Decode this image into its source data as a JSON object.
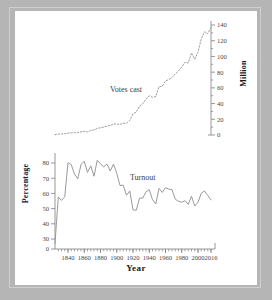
{
  "figure": {
    "background": "#b5b5b5",
    "canvas_background": "#ffffff",
    "line_color": "#9a9a9a",
    "axis_color": "#7d7d7d",
    "text_color": "#3d3d3d"
  },
  "labels": {
    "xlabel": "Year",
    "ylabel_left": "Percentage",
    "ylabel_right": "Million",
    "series_votes": "Votes cast",
    "series_turnout": "Turnout"
  },
  "chart_data": {
    "type": "line",
    "title": "",
    "xlabel": "Year",
    "grid": false,
    "legend": "inline-annotations",
    "xlim": [
      1824,
      2016
    ],
    "xticks": [
      1840,
      1860,
      1880,
      1900,
      1920,
      1940,
      1960,
      1980,
      2000,
      2016
    ],
    "xtick_labels": [
      "1840",
      "1860",
      "1880",
      "1900",
      "1920",
      "1940",
      "1960",
      "1980",
      "2000",
      "2016"
    ],
    "xtick_minor_step": 4,
    "axes": [
      {
        "name": "left",
        "label": "Percentage",
        "ylim": [
          0,
          85
        ],
        "ticks": [
          0,
          30,
          40,
          50,
          60,
          70,
          80
        ],
        "tick_labels": [
          "0",
          "30",
          "40",
          "50",
          "60",
          "70",
          "80"
        ],
        "broken": true,
        "note": "axis is broken between 0 and 30"
      },
      {
        "name": "right",
        "label": "Million",
        "ylim": [
          0,
          140
        ],
        "ticks": [
          0,
          20,
          40,
          60,
          80,
          100,
          120,
          140
        ],
        "tick_labels": [
          "0",
          "20",
          "40",
          "60",
          "80",
          "100",
          "120",
          "140"
        ],
        "minor_step": 10
      }
    ],
    "series": [
      {
        "name": "Turnout",
        "axis": "left",
        "unit": "percent",
        "style": "solid",
        "x": [
          1824,
          1828,
          1832,
          1836,
          1840,
          1844,
          1848,
          1852,
          1856,
          1860,
          1864,
          1868,
          1872,
          1876,
          1880,
          1884,
          1888,
          1892,
          1896,
          1900,
          1904,
          1908,
          1912,
          1916,
          1920,
          1924,
          1928,
          1932,
          1936,
          1940,
          1944,
          1948,
          1952,
          1956,
          1960,
          1964,
          1968,
          1972,
          1976,
          1980,
          1984,
          1988,
          1992,
          1996,
          2000,
          2004,
          2008,
          2012,
          2016
        ],
        "values": [
          26.9,
          57.6,
          55.4,
          57.8,
          80.2,
          78.9,
          72.7,
          69.6,
          78.9,
          81.2,
          73.8,
          78.1,
          71.3,
          81.8,
          79.4,
          77.5,
          79.3,
          74.7,
          79.3,
          73.2,
          65.2,
          65.4,
          58.8,
          61.6,
          49.2,
          48.9,
          56.9,
          56.9,
          61.0,
          62.5,
          55.9,
          53.0,
          63.3,
          60.6,
          63.8,
          62.8,
          62.5,
          56.2,
          54.8,
          54.2,
          55.2,
          52.8,
          58.1,
          51.7,
          54.2,
          60.1,
          61.6,
          58.6,
          55.7
        ]
      },
      {
        "name": "Votes cast",
        "axis": "right",
        "unit": "million",
        "style": "dotted",
        "x": [
          1824,
          1828,
          1832,
          1836,
          1840,
          1844,
          1848,
          1852,
          1856,
          1860,
          1864,
          1868,
          1872,
          1876,
          1880,
          1884,
          1888,
          1892,
          1896,
          1900,
          1904,
          1908,
          1912,
          1916,
          1920,
          1924,
          1928,
          1932,
          1936,
          1940,
          1944,
          1948,
          1952,
          1956,
          1960,
          1964,
          1968,
          1972,
          1976,
          1980,
          1984,
          1988,
          1992,
          1996,
          2000,
          2004,
          2008,
          2012,
          2016
        ],
        "values": [
          0.4,
          1.2,
          1.3,
          1.5,
          2.4,
          2.7,
          2.9,
          3.1,
          4.0,
          4.7,
          4.0,
          5.7,
          6.5,
          8.4,
          9.2,
          10.0,
          11.4,
          12.1,
          13.9,
          14.0,
          13.5,
          14.9,
          15.0,
          18.5,
          26.8,
          29.1,
          36.8,
          39.8,
          45.6,
          49.9,
          48.0,
          48.8,
          61.6,
          62.0,
          68.8,
          70.6,
          73.2,
          77.7,
          81.6,
          86.5,
          92.7,
          91.6,
          104.4,
          96.3,
          105.4,
          122.3,
          131.4,
          129.1,
          136.7
        ]
      }
    ]
  }
}
